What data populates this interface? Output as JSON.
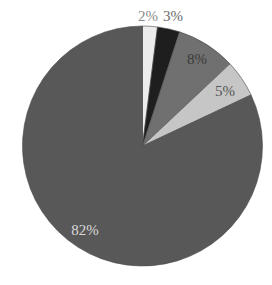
{
  "chart_data": {
    "type": "pie",
    "title": "",
    "start_angle_deg": 0,
    "direction": "clockwise",
    "slices": [
      {
        "label": "2%",
        "value": 2,
        "color": "#ececec",
        "label_color": "#8a8a8a"
      },
      {
        "label": "3%",
        "value": 3,
        "color": "#1e1e1e",
        "label_color": "#6a6a6a"
      },
      {
        "label": "8%",
        "value": 8,
        "color": "#707070",
        "label_color": "#3a3a3a"
      },
      {
        "label": "5%",
        "value": 5,
        "color": "#c6c6c6",
        "label_color": "#555555"
      },
      {
        "label": "82%",
        "value": 82,
        "color": "#585858",
        "label_color": "#d8d8d8"
      }
    ],
    "labels_visible": [
      "2%",
      "3%",
      "8%",
      "5%",
      "82%"
    ],
    "legend": "none"
  },
  "layout": {
    "cx": 142.5,
    "cy": 146,
    "r": 120,
    "label_positions": [
      {
        "x": 148,
        "y": 21,
        "anchor": "middle"
      },
      {
        "x": 173,
        "y": 21,
        "anchor": "middle"
      },
      {
        "x": 197,
        "y": 64,
        "anchor": "middle"
      },
      {
        "x": 225,
        "y": 96,
        "anchor": "middle"
      },
      {
        "x": 85,
        "y": 235,
        "anchor": "middle"
      }
    ]
  }
}
